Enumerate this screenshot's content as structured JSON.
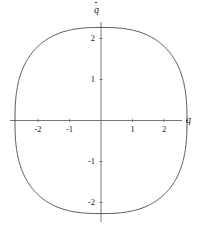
{
  "figure": {
    "width": 202,
    "height": 230,
    "background_color": "#ffffff",
    "line_color": "#3a3a3a",
    "axis_color": "#555555",
    "text_color": "#222222"
  },
  "axes": {
    "x_axis_label": "q",
    "y_axis_label": "q",
    "y_axis_label_accent": "dot",
    "origin_px": {
      "x": 101,
      "y": 120.5
    },
    "px_per_unit_x": 31.5,
    "px_per_unit_y": 41.0,
    "x_axis_line": {
      "x1": 10,
      "x2": 182,
      "y": 120.5
    },
    "y_axis_line": {
      "x": 101,
      "y1": 22,
      "y2": 222
    },
    "x_ticks": [
      {
        "value": -2,
        "label": "-2",
        "px": 38
      },
      {
        "value": -1,
        "label": "-1",
        "px": 69.5
      },
      {
        "value": 1,
        "label": "1",
        "px": 132.5
      },
      {
        "value": 2,
        "label": "2",
        "px": 164
      }
    ],
    "y_ticks": [
      {
        "value": 2,
        "label": "2",
        "px": 38.5
      },
      {
        "value": 1,
        "label": "1",
        "px": 79.5
      },
      {
        "value": -1,
        "label": "-1",
        "px": 161.5
      },
      {
        "value": -2,
        "label": "-2",
        "px": 202.5
      }
    ],
    "tick_length_px": 3,
    "grid": false,
    "legend": false
  },
  "chart_data": {
    "type": "line",
    "title": "",
    "subtitle": "",
    "xlabel": "q",
    "ylabel": "qdot",
    "xlim": [
      -2.9,
      2.6
    ],
    "ylim": [
      -2.4,
      2.4
    ],
    "grid": false,
    "legend_position": "none",
    "annotations": [],
    "series": [
      {
        "name": "limit-cycle",
        "closed": true,
        "description": "closed periodic orbit (limit cycle) in the q - qdot phase plane, rounded-square / superellipse shape",
        "shape": "superellipse",
        "exponent": 2.6,
        "semi_axis_x": 2.73,
        "semi_axis_y": 2.27,
        "x_extent": [
          -2.73,
          2.73
        ],
        "y_extent": [
          -2.27,
          2.27
        ],
        "x": [
          2.73,
          2.72,
          2.68,
          2.62,
          2.53,
          2.41,
          2.26,
          2.07,
          1.85,
          1.59,
          1.29,
          0.97,
          0.64,
          0.32,
          0.0,
          -0.32,
          -0.64,
          -0.97,
          -1.29,
          -1.59,
          -1.85,
          -2.07,
          -2.26,
          -2.41,
          -2.53,
          -2.62,
          -2.68,
          -2.72,
          -2.73,
          -2.72,
          -2.68,
          -2.62,
          -2.53,
          -2.41,
          -2.26,
          -2.07,
          -1.85,
          -1.59,
          -1.29,
          -0.97,
          -0.64,
          -0.32,
          0.0,
          0.32,
          0.64,
          0.97,
          1.29,
          1.59,
          1.85,
          2.07,
          2.26,
          2.41,
          2.53,
          2.62,
          2.68,
          2.72,
          2.73
        ],
        "y": [
          0.0,
          0.27,
          0.54,
          0.79,
          1.03,
          1.25,
          1.45,
          1.63,
          1.79,
          1.93,
          2.04,
          2.13,
          2.19,
          2.24,
          2.27,
          2.24,
          2.19,
          2.13,
          2.04,
          1.93,
          1.79,
          1.63,
          1.45,
          1.25,
          1.03,
          0.79,
          0.54,
          0.27,
          0.0,
          -0.27,
          -0.54,
          -0.79,
          -1.03,
          -1.25,
          -1.45,
          -1.63,
          -1.79,
          -1.93,
          -2.04,
          -2.13,
          -2.19,
          -2.24,
          -2.27,
          -2.24,
          -2.19,
          -2.13,
          -2.04,
          -1.93,
          -1.79,
          -1.63,
          -1.45,
          -1.25,
          -1.03,
          -0.79,
          -0.54,
          -0.27,
          0.0
        ]
      }
    ]
  }
}
